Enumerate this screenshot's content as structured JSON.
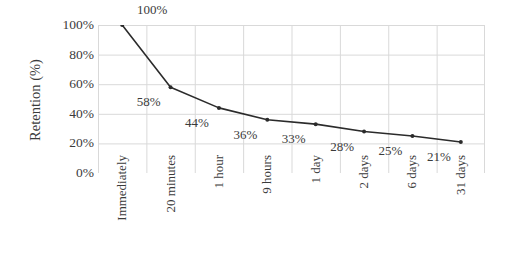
{
  "chart_data": {
    "type": "line",
    "title": "",
    "xlabel": "",
    "ylabel": "Retention (%)",
    "categories": [
      "Immediately",
      "20 minutes",
      "1 hour",
      "9 hours",
      "1 day",
      "2 days",
      "6 days",
      "31 days"
    ],
    "values": [
      100,
      58,
      44,
      36,
      33,
      28,
      25,
      21
    ],
    "data_labels": [
      "100%",
      "58%",
      "44%",
      "36%",
      "33%",
      "28%",
      "25%",
      "21%"
    ],
    "ylim": [
      0,
      100
    ],
    "y_ticks": [
      0,
      20,
      40,
      60,
      80,
      100
    ],
    "y_tick_labels": [
      "0%",
      "20%",
      "40%",
      "60%",
      "80%",
      "100%"
    ],
    "grid": true,
    "legend": "none",
    "series": [
      {
        "name": "Retention",
        "values": [
          100,
          58,
          44,
          36,
          33,
          28,
          25,
          21
        ],
        "line_color": "#2b2b2b",
        "marker_color": "#2b2b2b"
      }
    ]
  },
  "axes": {
    "y_title": "Retention (%)",
    "grid_color": "#d9d9d9",
    "text_color": "#3b3b3b"
  }
}
